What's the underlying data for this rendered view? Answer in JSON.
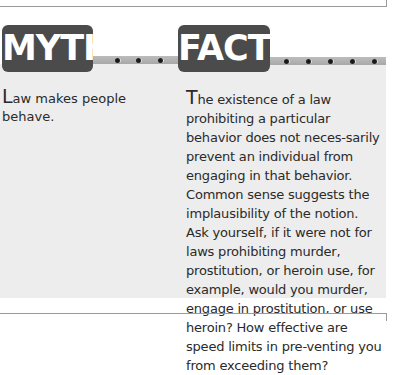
{
  "myth": {
    "badge_label": "MYTH",
    "dropcap": "L",
    "text": "aw makes people behave."
  },
  "fact": {
    "badge_label": "FACT",
    "dropcap": "T",
    "text": "he existence of a law prohibiting a particular behavior does not neces-sarily prevent an individual from engaging in that behavior. Common sense suggests the implausibility of the notion. Ask yourself, if it were not for laws prohibiting murder, prostitution, or heroin use, for example, would you murder, engage in prostitution, or use heroin? How effective are speed limits in pre-venting you from exceeding them?"
  },
  "colors": {
    "badge": "#4b4b4b",
    "panel": "#ededed",
    "strip": "#b2b2b2",
    "text": "#2a2a2a"
  }
}
